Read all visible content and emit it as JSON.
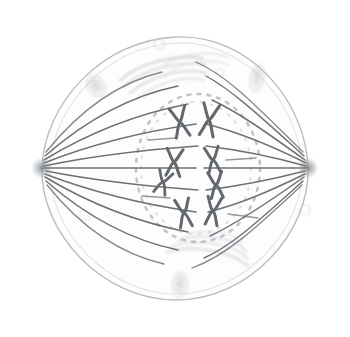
{
  "figure": {
    "title": "Cell in metaphase of mitosis",
    "caption": "",
    "style": "pencil sketch / hand drawing",
    "background_color": "#ffffff"
  },
  "colors": {
    "membrane": "#b9bcc0",
    "cytoplasm": "#fcfcfd",
    "spindle_fiber": "#6d7175",
    "spindle_fiber_light": "#9aa0a4",
    "chromosome": "#63686d",
    "nuclear_envelope_dots": "#b6bbbf",
    "organelle": "#c9ccd0",
    "organelle_light": "#dcdfe2",
    "centrosome": "#7b8085"
  },
  "cell": {
    "name": "animal-cell",
    "shape": "lens / rounded-diamond",
    "center_x": 175,
    "center_y": 168,
    "radius_x": 140,
    "radius_y": 132,
    "membrane_stroke_width": 1.4
  },
  "poles": [
    {
      "label": "left-spindle-pole",
      "x": 42,
      "y": 168,
      "radius": 9
    },
    {
      "label": "right-spindle-pole",
      "x": 308,
      "y": 168,
      "radius": 9
    }
  ],
  "spindle": {
    "label": "mitotic-spindle",
    "fiber_count": 18,
    "fiber_stroke_width": 1.5,
    "description": "microtubules radiating from each centrosome toward the metaphase plate"
  },
  "metaphase_plate": {
    "label": "metaphase-plate",
    "x": 200,
    "y_top": 96,
    "y_bottom": 240
  },
  "nuclear_envelope": {
    "label": "disassembling-nuclear-envelope",
    "center_x": 198,
    "center_y": 168,
    "radius_x": 62,
    "radius_y": 74,
    "dash_pattern": "3 6",
    "stroke_width": 2.4
  },
  "chromosomes": [
    {
      "id": "chr-1",
      "column": "left",
      "x": 180,
      "y": 122,
      "rotation": -12,
      "size": 15
    },
    {
      "id": "chr-2",
      "column": "right",
      "x": 209,
      "y": 120,
      "rotation": 10,
      "size": 16
    },
    {
      "id": "chr-3",
      "column": "left",
      "x": 174,
      "y": 162,
      "rotation": 5,
      "size": 14
    },
    {
      "id": "chr-4",
      "column": "right",
      "x": 213,
      "y": 160,
      "rotation": -8,
      "size": 13
    },
    {
      "id": "chr-5",
      "column": "left",
      "x": 163,
      "y": 182,
      "rotation": 18,
      "size": 12
    },
    {
      "id": "chr-6",
      "column": "right",
      "x": 216,
      "y": 185,
      "rotation": -6,
      "size": 14
    },
    {
      "id": "chr-7",
      "column": "left",
      "x": 184,
      "y": 213,
      "rotation": -10,
      "size": 14
    },
    {
      "id": "chr-8",
      "column": "right",
      "x": 213,
      "y": 211,
      "rotation": 8,
      "size": 14
    }
  ],
  "organelles": [
    {
      "id": "org-1",
      "kind": "mitochondrion",
      "x": 96,
      "y": 86,
      "rx": 9,
      "ry": 12,
      "rotation": -35
    },
    {
      "id": "org-2",
      "kind": "mitochondrion",
      "x": 257,
      "y": 78,
      "rx": 7,
      "ry": 14,
      "rotation": 12
    },
    {
      "id": "org-3",
      "kind": "mitochondrion",
      "x": 180,
      "y": 285,
      "rx": 8,
      "ry": 13,
      "rotation": 5
    },
    {
      "id": "org-4",
      "kind": "vesicle",
      "x": 159,
      "y": 44,
      "rx": 5,
      "ry": 5,
      "rotation": 0
    },
    {
      "id": "org-5",
      "kind": "vesicle",
      "x": 84,
      "y": 215,
      "rx": 5,
      "ry": 5,
      "rotation": 0
    },
    {
      "id": "org-6",
      "kind": "vesicle",
      "x": 305,
      "y": 210,
      "rx": 5,
      "ry": 5,
      "rotation": 0
    },
    {
      "id": "org-7",
      "kind": "vesicle",
      "x": 220,
      "y": 73,
      "rx": 4,
      "ry": 4,
      "rotation": 0
    },
    {
      "id": "org-8",
      "kind": "endoplasmic-reticulum",
      "x": 165,
      "y": 75,
      "rx": 46,
      "ry": 16,
      "rotation": -14
    },
    {
      "id": "org-9",
      "kind": "golgi-apparatus",
      "x": 210,
      "y": 252,
      "rx": 44,
      "ry": 15,
      "rotation": 10
    }
  ]
}
